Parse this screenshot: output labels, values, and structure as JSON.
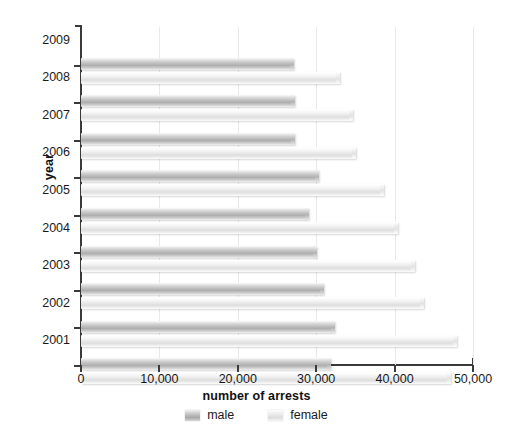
{
  "chart_data": {
    "type": "bar",
    "orientation": "horizontal",
    "title": "",
    "xlabel": "number of arrests",
    "ylabel": "year",
    "xlim": [
      0,
      50000
    ],
    "xticks": [
      0,
      10000,
      20000,
      30000,
      40000,
      50000
    ],
    "xticklabels": [
      "0",
      "10,000",
      "20,000",
      "30,000",
      "40,000",
      "50,000"
    ],
    "categories": [
      "2009",
      "2008",
      "2007",
      "2006",
      "2005",
      "2004",
      "2003",
      "2002",
      "2001"
    ],
    "grid": true,
    "legend_position": "bottom",
    "series": [
      {
        "name": "male",
        "color": "#b9b9b9",
        "values": [
          27200,
          27300,
          27300,
          30400,
          29100,
          30100,
          31000,
          32400,
          31900
        ]
      },
      {
        "name": "female",
        "color": "#e7e7e7",
        "values": [
          33000,
          34700,
          35100,
          38700,
          40400,
          42600,
          43800,
          47900,
          47200
        ]
      }
    ]
  },
  "legend": {
    "entries": [
      {
        "label": "male"
      },
      {
        "label": "female"
      }
    ]
  },
  "colors": {
    "axis": "#3a3a3a",
    "grid": "#e9e9e9",
    "male": "#b9b9b9",
    "female": "#e7e7e7",
    "text": "#1a1a1a",
    "background": "#ffffff"
  }
}
